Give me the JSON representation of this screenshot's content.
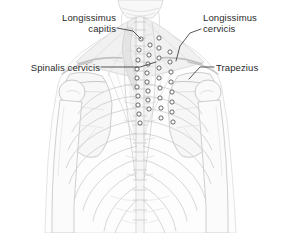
{
  "figure": {
    "background_color": "#ffffff",
    "width": 281,
    "height": 233,
    "style": "grayscale line illustration"
  },
  "palette": {
    "text": "#2a2a2a",
    "leader_line": "#3a3a3a",
    "bone_fill": "#fbfbfb",
    "bone_stroke": "#b9b9b9",
    "muscle_fill": "#ececec",
    "muscle_stroke": "#c4c4c4",
    "shadow_fill": "#e2e2e2",
    "marker_stroke": "#4a4a4a",
    "marker_fill": "#ffffff"
  },
  "labels": [
    {
      "id": "longissimus-capitis",
      "text": "Longissimus\ncapitis",
      "line1": "Longissimus",
      "line2": "capitis",
      "align": "right",
      "position": {
        "x": 34,
        "y": 12
      }
    },
    {
      "id": "longissimus-cervicis",
      "text": "Longissimus\ncervicis",
      "line1": "Longissimus",
      "line2": "cervicis",
      "align": "left",
      "position": {
        "x": 203,
        "y": 12
      }
    },
    {
      "id": "spinalis-cervicis",
      "text": "Spinalis cervicis",
      "line1": "Spinalis cervicis",
      "align": "right",
      "position": {
        "x": 14,
        "y": 62
      }
    },
    {
      "id": "trapezius",
      "text": "Trapezius",
      "line1": "Trapezius",
      "align": "left",
      "position": {
        "x": 216,
        "y": 62
      }
    }
  ],
  "leader_lines": [
    {
      "id": "leader-longissimus-capitis",
      "path": "M117,28 L133,31 L141,39"
    },
    {
      "id": "leader-longissimus-cervicis",
      "path": "M201,29 L190,33 L180,46 L176,61"
    },
    {
      "id": "leader-spinalis-cervicis",
      "path": "M101,67 L140,67 L156,62"
    },
    {
      "id": "leader-trapezius",
      "path": "M214,67 L200,67 L189,79"
    }
  ],
  "anatomy_regions": [
    {
      "id": "skull-base",
      "name": "occipital region of skull"
    },
    {
      "id": "cervical-spine",
      "name": "cervical vertebrae column"
    },
    {
      "id": "thoracic-spine",
      "name": "thoracic vertebrae column"
    },
    {
      "id": "rib-cage",
      "name": "posterior rib cage"
    },
    {
      "id": "scapula-left",
      "name": "left scapula"
    },
    {
      "id": "scapula-right",
      "name": "right scapula"
    },
    {
      "id": "humerus-left",
      "name": "left humerus"
    },
    {
      "id": "humerus-right",
      "name": "right humerus"
    },
    {
      "id": "clavicle-left",
      "name": "left clavicle"
    },
    {
      "id": "clavicle-right",
      "name": "right clavicle"
    },
    {
      "id": "trapezius-muscle",
      "name": "trapezius muscle outline"
    },
    {
      "id": "erector-spinae",
      "name": "erector spinae muscle group"
    }
  ],
  "marker_columns": {
    "description": "small circular muscle attachment markers along the vertebral column",
    "columns": [
      {
        "id": "col-far-left",
        "x": 141,
        "count": 14
      },
      {
        "id": "col-mid-left",
        "x": 152,
        "count": 13
      },
      {
        "id": "col-mid-right",
        "x": 163,
        "count": 12
      },
      {
        "id": "col-far-right",
        "x": 174,
        "count": 12
      }
    ]
  }
}
